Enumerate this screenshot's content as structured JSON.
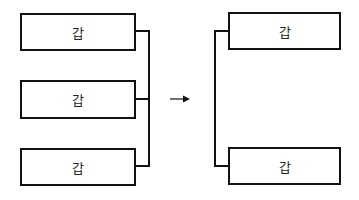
{
  "diagram": {
    "left_group": {
      "boxes": [
        {
          "label": "갑"
        },
        {
          "label": "갑"
        },
        {
          "label": "갑"
        }
      ]
    },
    "arrow": {
      "direction": "right"
    },
    "right_group": {
      "boxes": [
        {
          "label": "갑"
        },
        {
          "label": "갑"
        }
      ]
    },
    "colors": {
      "stroke": "#111111",
      "background": "#ffffff"
    }
  }
}
